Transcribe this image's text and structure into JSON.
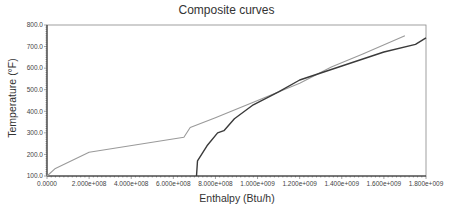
{
  "chart_data": {
    "type": "line",
    "title": "Composite curves",
    "xlabel": "Enthalpy (Btu/h)",
    "ylabel": "Temperature (°F)",
    "xlim": [
      0,
      1800000000
    ],
    "ylim": [
      100,
      800
    ],
    "grid": false,
    "legend": null,
    "x_ticks": [
      "0.0000",
      "2.000e+008",
      "4.000e+008",
      "6.000e+008",
      "8.000e+008",
      "1.000e+009",
      "1.200e+009",
      "1.400e+009",
      "1.600e+009",
      "1.800e+009"
    ],
    "y_ticks": [
      "100.0",
      "200.0",
      "300.0",
      "400.0",
      "500.0",
      "600.0",
      "700.0",
      "800.0"
    ],
    "series": [
      {
        "name": "Hot composite curve",
        "color": "#9a9a9a",
        "points": [
          [
            0,
            100
          ],
          [
            40000000,
            135
          ],
          [
            200000000,
            210
          ],
          [
            650000000,
            280
          ],
          [
            680000000,
            325
          ],
          [
            800000000,
            370
          ],
          [
            1000000000,
            450
          ],
          [
            1200000000,
            530
          ],
          [
            1350000000,
            605
          ],
          [
            1500000000,
            665
          ],
          [
            1700000000,
            750
          ]
        ]
      },
      {
        "name": "Cold composite curve",
        "color": "#3a3a3a",
        "points": [
          [
            710000000,
            100
          ],
          [
            715000000,
            170
          ],
          [
            760000000,
            240
          ],
          [
            810000000,
            300
          ],
          [
            840000000,
            310
          ],
          [
            890000000,
            365
          ],
          [
            980000000,
            430
          ],
          [
            1100000000,
            490
          ],
          [
            1200000000,
            545
          ],
          [
            1400000000,
            610
          ],
          [
            1600000000,
            675
          ],
          [
            1750000000,
            710
          ],
          [
            1800000000,
            740
          ]
        ]
      }
    ]
  }
}
